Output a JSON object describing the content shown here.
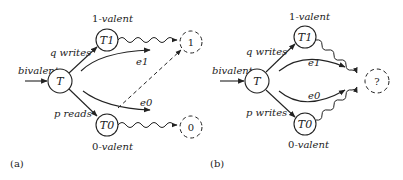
{
  "panel_a": {
    "caption": "(a)",
    "input_label": "bivalent",
    "nodes": {
      "T": "T",
      "T1": "T1",
      "T0": "T0",
      "out1": "1",
      "out0": "0"
    },
    "top_valence": {
      "num": "1",
      "word": "-valent"
    },
    "bottom_valence": {
      "num": "0",
      "word": "-valent"
    },
    "edge_top": "q writes",
    "edge_bottom": "p reads",
    "e1": "e1",
    "e0": "e0"
  },
  "panel_b": {
    "caption": "(b)",
    "input_label": "bivalent",
    "nodes": {
      "T": "T",
      "T1": "T1",
      "T0": "T0",
      "out": "?"
    },
    "top_valence": {
      "num": "1",
      "word": "-valent"
    },
    "bottom_valence": {
      "num": "0",
      "word": "-valent"
    },
    "edge_top": "q writes",
    "edge_bottom": "p writes",
    "e1": "e1",
    "e0": "e0"
  },
  "colors": {
    "stroke": "#222222",
    "background": "#ffffff"
  }
}
